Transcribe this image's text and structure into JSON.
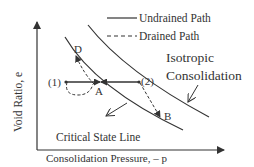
{
  "diagram": {
    "x_axis_label": "Consolidation Pressure, – p",
    "y_axis_label": "Void Ratio, e",
    "legend": [
      {
        "label": "Undrained Path",
        "style": "solid"
      },
      {
        "label": "Drained Path",
        "style": "dashed"
      }
    ],
    "curves": {
      "isotropic_label_line1": "Isotropic",
      "isotropic_label_line2": "Consolidation",
      "csl_label": "Critical State Line"
    },
    "points": {
      "p1": "(1)",
      "p2": "(2)",
      "A": "A",
      "B": "B",
      "D": "D"
    },
    "colors": {
      "line": "#333333",
      "background": "#ffffff"
    }
  }
}
